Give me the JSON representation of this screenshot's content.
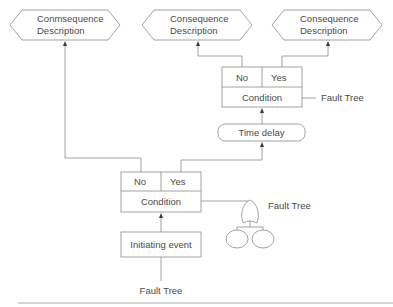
{
  "diagram": {
    "type": "event-tree",
    "consequences": [
      {
        "line1": "Conmsequence",
        "line2": "Description"
      },
      {
        "line1": "Consequence",
        "line2": "Description"
      },
      {
        "line1": "Consequence",
        "line2": "Description"
      }
    ],
    "top_condition": {
      "no_label": "No",
      "yes_label": "Yes",
      "label": "Condition",
      "fault_tree_label": "Fault Tree"
    },
    "time_delay": {
      "label": "Time delay"
    },
    "lower_condition": {
      "no_label": "No",
      "yes_label": "Yes",
      "label": "Condition",
      "fault_tree_label": "Fault Tree"
    },
    "initiating_event": {
      "label": "Initiating event"
    },
    "bottom_fault_tree_label": "Fault Tree"
  }
}
